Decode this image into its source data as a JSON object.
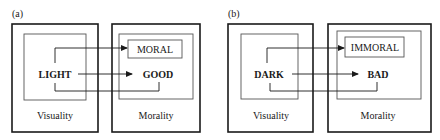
{
  "panels": [
    {
      "label": "(a)",
      "left_box": {
        "title": "Visuality",
        "node": "LIGHT"
      },
      "right_box": {
        "title": "Morality",
        "boxed_node": "MORAL",
        "node": "GOOD"
      }
    },
    {
      "label": "(b)",
      "left_box": {
        "title": "Visuality",
        "node": "DARK"
      },
      "right_box": {
        "title": "Morality",
        "boxed_node": "IMMORAL",
        "node": "BAD"
      }
    }
  ],
  "colors": {
    "stroke": "#1a1a1a",
    "inner_stroke": "#555555",
    "background": "#ffffff"
  }
}
